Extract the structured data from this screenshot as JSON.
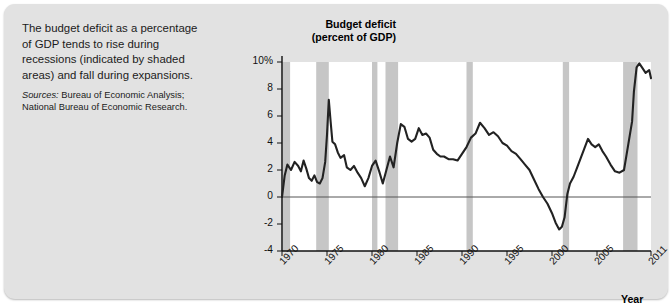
{
  "caption": {
    "lead": "The budget deficit as a percentage of GDP tends to rise during recessions (indicated by shaded areas) and fall during expansions.",
    "sources_label": "Sources:",
    "sources_text": " Bureau of Economic Analysis; National Bureau of Economic Research."
  },
  "chart_data": {
    "type": "line",
    "title": "Budget deficit (percent of GDP)",
    "title_line1": "Budget deficit",
    "title_line2": "(percent of GDP)",
    "xlabel": "Year",
    "ylabel": "Budget deficit (percent of GDP)",
    "xlim": [
      1970,
      2011
    ],
    "ylim": [
      -4,
      10
    ],
    "grid": false,
    "legend": "none",
    "xtick_labels": [
      "1970",
      "1975",
      "1980",
      "1985",
      "1990",
      "1995",
      "2000",
      "2005",
      "2011"
    ],
    "xticks": [
      1970,
      1975,
      1980,
      1985,
      1990,
      1995,
      2000,
      2005,
      2011
    ],
    "ytick_labels": [
      "10%",
      "8",
      "6",
      "4",
      "2",
      "0",
      "-2",
      "-4"
    ],
    "yticks": [
      10,
      8,
      6,
      4,
      2,
      0,
      -2,
      -4
    ],
    "zero_line": 0,
    "line_color": "#222222",
    "band_color": "#c6c6c6",
    "panel_color": "#e2e2e2",
    "recession_bands": [
      {
        "label": "1969-1970 recession",
        "start": 1969.9,
        "end": 1970.9
      },
      {
        "label": "1973-1975 recession",
        "start": 1973.8,
        "end": 1975.2
      },
      {
        "label": "1980 recession",
        "start": 1980.0,
        "end": 1980.6
      },
      {
        "label": "1981-1982 recession",
        "start": 1981.5,
        "end": 1982.9
      },
      {
        "label": "1990-1991 recession",
        "start": 1990.5,
        "end": 1991.2
      },
      {
        "label": "2001 recession",
        "start": 2001.2,
        "end": 2001.9
      },
      {
        "label": "2007-2009 recession",
        "start": 2007.9,
        "end": 2009.5
      }
    ],
    "x": [
      1970.0,
      1970.3,
      1970.6,
      1971.0,
      1971.4,
      1971.8,
      1972.1,
      1972.4,
      1972.7,
      1973.0,
      1973.3,
      1973.6,
      1973.9,
      1974.2,
      1974.5,
      1974.8,
      1975.0,
      1975.2,
      1975.4,
      1975.6,
      1975.9,
      1976.2,
      1976.5,
      1976.9,
      1977.2,
      1977.6,
      1978.0,
      1978.4,
      1978.8,
      1979.2,
      1979.6,
      1980.0,
      1980.4,
      1980.8,
      1981.2,
      1981.6,
      1982.0,
      1982.4,
      1982.8,
      1983.2,
      1983.6,
      1984.0,
      1984.4,
      1984.8,
      1985.2,
      1985.6,
      1986.0,
      1986.4,
      1986.8,
      1987.2,
      1987.6,
      1988.0,
      1988.5,
      1989.0,
      1989.5,
      1990.0,
      1990.5,
      1991.0,
      1991.5,
      1992.0,
      1992.5,
      1993.0,
      1993.5,
      1994.0,
      1994.5,
      1995.0,
      1995.5,
      1996.0,
      1996.5,
      1997.0,
      1997.5,
      1998.0,
      1998.5,
      1999.0,
      1999.5,
      2000.0,
      2000.4,
      2000.8,
      2001.1,
      2001.4,
      2001.7,
      2002.0,
      2002.4,
      2002.8,
      2003.2,
      2003.6,
      2004.0,
      2004.4,
      2004.8,
      2005.2,
      2005.6,
      2006.0,
      2006.5,
      2007.0,
      2007.5,
      2008.0,
      2008.3,
      2008.6,
      2008.9,
      2009.1,
      2009.4,
      2009.7,
      2010.0,
      2010.4,
      2010.8,
      2011.0
    ],
    "y": [
      0.0,
      1.6,
      2.4,
      2.0,
      2.6,
      2.3,
      1.9,
      2.7,
      2.1,
      1.4,
      1.2,
      1.6,
      1.1,
      1.0,
      1.4,
      2.6,
      4.6,
      7.2,
      5.6,
      4.1,
      3.9,
      3.3,
      2.9,
      3.1,
      2.2,
      2.0,
      2.3,
      1.8,
      1.4,
      0.8,
      1.4,
      2.3,
      2.7,
      1.9,
      1.0,
      2.0,
      3.0,
      2.2,
      4.0,
      5.4,
      5.2,
      4.3,
      4.1,
      4.3,
      5.1,
      4.6,
      4.7,
      4.4,
      3.5,
      3.2,
      3.0,
      3.0,
      2.8,
      2.8,
      2.7,
      3.2,
      3.7,
      4.4,
      4.7,
      5.5,
      5.1,
      4.6,
      4.8,
      4.5,
      4.0,
      3.8,
      3.4,
      3.2,
      2.8,
      2.4,
      2.0,
      1.3,
      0.6,
      0.0,
      -0.5,
      -1.2,
      -1.9,
      -2.4,
      -2.2,
      -1.5,
      0.2,
      1.0,
      1.5,
      2.2,
      2.9,
      3.6,
      4.3,
      3.9,
      3.7,
      3.9,
      3.4,
      3.0,
      2.4,
      1.9,
      1.8,
      2.0,
      3.2,
      4.4,
      5.6,
      7.8,
      9.6,
      9.9,
      9.6,
      9.2,
      9.4,
      8.8
    ]
  }
}
